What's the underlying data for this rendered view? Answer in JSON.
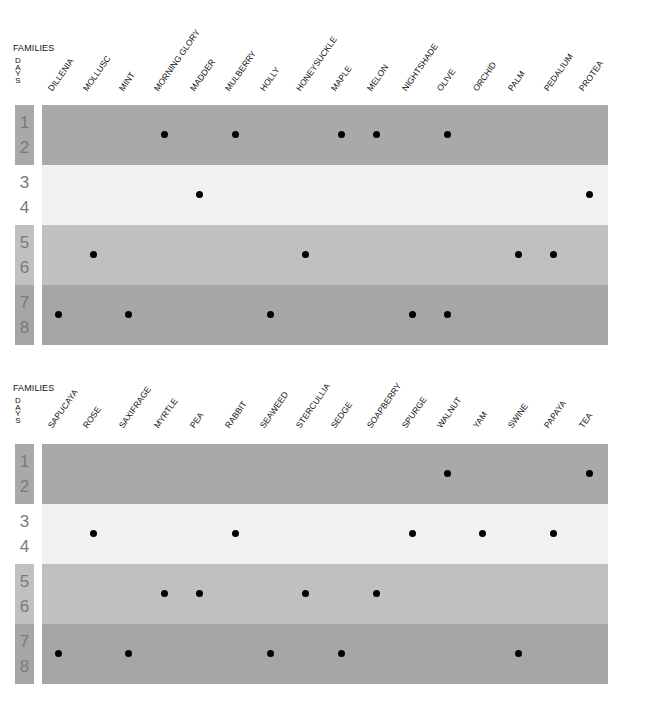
{
  "chart_data": [
    {
      "type": "scatter",
      "title": "",
      "header_label": "FAMILIES",
      "row_axis_label": "DAYS",
      "categories": [
        "DILLENIA",
        "MOLLUSC",
        "MINT",
        "MORNING GLORY",
        "MADDER",
        "MULBERRY",
        "HOLLY",
        "HONEYSUCKLE",
        "MAPLE",
        "MELON",
        "NIGHTSHADE",
        "OLIVE",
        "ORCHID",
        "PALM",
        "PEDALIUM",
        "PROTEA"
      ],
      "rows": [
        {
          "days": [
            "1",
            "2"
          ],
          "color": "#a9a9a9",
          "label_color": "#a9a9a9",
          "families": [
            "MORNING GLORY",
            "MULBERRY",
            "MAPLE",
            "MELON",
            "OLIVE"
          ]
        },
        {
          "days": [
            "3",
            "4"
          ],
          "color": "#f1f1f1",
          "label_color": "#ffffff",
          "families": [
            "MADDER",
            "PROTEA"
          ]
        },
        {
          "days": [
            "5",
            "6"
          ],
          "color": "#c0c0c0",
          "label_color": "#c0c0c0",
          "families": [
            "MOLLUSC",
            "HONEYSUCKLE",
            "PALM",
            "PEDALIUM"
          ]
        },
        {
          "days": [
            "7",
            "8"
          ],
          "color": "#a6a6a6",
          "label_color": "#a6a6a6",
          "families": [
            "DILLENIA",
            "MINT",
            "HOLLY",
            "NIGHTSHADE",
            "OLIVE"
          ]
        }
      ]
    },
    {
      "type": "scatter",
      "title": "",
      "header_label": "FAMILIES",
      "row_axis_label": "DAYS",
      "categories": [
        "SAPUCAYA",
        "ROSE",
        "SAXIFRAGE",
        "MYRTLE",
        "PEA",
        "RABBIT",
        "SEAWEED",
        "STERCULLIA",
        "SEDGE",
        "SOAPBERRY",
        "SPURGE",
        "WALNUT",
        "YAM",
        "SWINE",
        "PAPAYA",
        "TEA"
      ],
      "rows": [
        {
          "days": [
            "1",
            "2"
          ],
          "color": "#a9a9a9",
          "label_color": "#a9a9a9",
          "families": [
            "WALNUT",
            "TEA"
          ]
        },
        {
          "days": [
            "3",
            "4"
          ],
          "color": "#f1f1f1",
          "label_color": "#ffffff",
          "families": [
            "ROSE",
            "RABBIT",
            "SPURGE",
            "YAM",
            "PAPAYA"
          ]
        },
        {
          "days": [
            "5",
            "6"
          ],
          "color": "#c0c0c0",
          "label_color": "#c0c0c0",
          "families": [
            "MYRTLE",
            "PEA",
            "STERCULLIA",
            "SOAPBERRY"
          ]
        },
        {
          "days": [
            "7",
            "8"
          ],
          "color": "#a6a6a6",
          "label_color": "#a6a6a6",
          "families": [
            "SAPUCAYA",
            "SAXIFRAGE",
            "SEAWEED",
            "SEDGE",
            "SWINE"
          ]
        }
      ]
    }
  ]
}
